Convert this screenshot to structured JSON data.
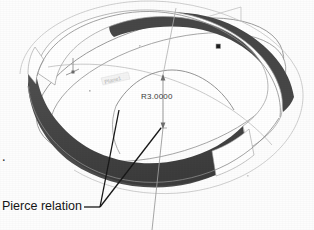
{
  "document": {
    "type": "cad-isometric-view",
    "background_color": "#fdfdfd"
  },
  "annotations": {
    "heading_fragment": "on",
    "body_dot": ".",
    "pierce_label": "Pierce relation",
    "plane_label": "Plane1"
  },
  "dimensions": {
    "radius": {
      "label": "R3.0000",
      "value": "3.0000",
      "prefix": "R"
    }
  },
  "colors": {
    "shaded_face": "#4b4b4b",
    "shaded_face_dark": "#3f3f3f",
    "unshaded_face": "#ffffff",
    "outline": "#6e6e6e",
    "plane_outline": "#c9c9c9",
    "leader_line": "#161616",
    "dimension_line": "#8a8a8a",
    "text": "#141414"
  },
  "geometry": {
    "band": {
      "shape": "elliptical-ring-swept-band",
      "segments_shaded": 2,
      "segments_white": 2
    },
    "reference_plane": {
      "shape": "quadrilateral",
      "position": "top-right"
    },
    "origin_triad": {
      "position": "interior-upper-left"
    },
    "vertex_marker": {
      "count": 1,
      "position": "on-upper-band"
    },
    "leader_lines": {
      "count": 2,
      "converge_at": "lower-left"
    }
  }
}
